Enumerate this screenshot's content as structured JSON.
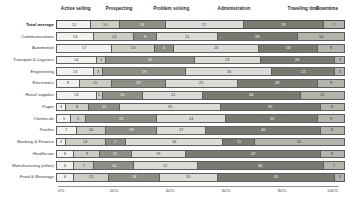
{
  "chart_data": {
    "type": "bar",
    "title": "",
    "subtype": "stacked-horizontal-100-percent",
    "xlabel": "",
    "ylabel": "",
    "xlim": [
      0,
      100
    ],
    "xticks": [
      "0%",
      "20%",
      "40%",
      "60%",
      "80%",
      "100%"
    ],
    "xtick_values": [
      0,
      20,
      40,
      60,
      80,
      100
    ],
    "grid": false,
    "legend_position": "top",
    "series": [
      {
        "name": "Active selling",
        "color": "#f2f2ee"
      },
      {
        "name": "Prospecting",
        "color": "#cdcdc6"
      },
      {
        "name": "Problem solving",
        "color": "#8f8f88"
      },
      {
        "name": "Administration",
        "color": "#dcdcd6"
      },
      {
        "name": "Traveling time",
        "color": "#7a7a73"
      },
      {
        "name": "Downtime",
        "color": "#b4b4ad"
      }
    ],
    "categories": [
      "Total average",
      "Communications",
      "Automotive",
      "Transport & Logistics",
      "Engineering",
      "Electronics",
      "Retail supplies",
      "Paper",
      "Chemicals",
      "Textiles",
      "Banking & Finance",
      "Healthcare",
      "Manufacturing (other)",
      "Food & Beverage"
    ],
    "rows": [
      {
        "category": "Total average",
        "emphasis": true,
        "values": [
          12,
          10,
          16,
          27,
          28,
          7
        ]
      },
      {
        "category": "Communications",
        "emphasis": false,
        "values": [
          13,
          14,
          8,
          21,
          28,
          16
        ]
      },
      {
        "category": "Automotive",
        "emphasis": false,
        "values": [
          17,
          13,
          6,
          26,
          18,
          8
        ]
      },
      {
        "category": "Transport & Logistics",
        "emphasis": false,
        "values": [
          14,
          3,
          31,
          23,
          26,
          3
        ]
      },
      {
        "category": "Engineering",
        "emphasis": false,
        "values": [
          13,
          3,
          29,
          30,
          22,
          3
        ]
      },
      {
        "category": "Electronics",
        "emphasis": false,
        "values": [
          8,
          11,
          19,
          25,
          28,
          9
        ]
      },
      {
        "category": "Retail supplies",
        "emphasis": false,
        "values": [
          14,
          2,
          14,
          21,
          34,
          15
        ]
      },
      {
        "category": "Paper",
        "emphasis": false,
        "values": [
          3,
          8,
          11,
          35,
          35,
          8
        ]
      },
      {
        "category": "Chemicals",
        "emphasis": false,
        "values": [
          5,
          5,
          25,
          24,
          32,
          9
        ]
      },
      {
        "category": "Textiles",
        "emphasis": false,
        "values": [
          7,
          10,
          18,
          17,
          40,
          8
        ]
      },
      {
        "category": "Banking & Finance",
        "emphasis": false,
        "values": [
          3,
          14,
          7,
          34,
          11,
          31
        ]
      },
      {
        "category": "Healthcare",
        "emphasis": false,
        "values": [
          6,
          9,
          11,
          19,
          47,
          8
        ]
      },
      {
        "category": "Manufacturing (other)",
        "emphasis": false,
        "values": [
          6,
          7,
          14,
          22,
          44,
          7
        ]
      },
      {
        "category": "Food & Beverage",
        "emphasis": false,
        "values": [
          6,
          12,
          18,
          20,
          41,
          3
        ]
      }
    ],
    "segment_header_positions_pct": [
      1,
      17,
      34,
      57,
      82,
      96
    ],
    "value_label_colors": {
      "on_light": "#2e2e2e",
      "on_dark": "#ffffff"
    }
  }
}
